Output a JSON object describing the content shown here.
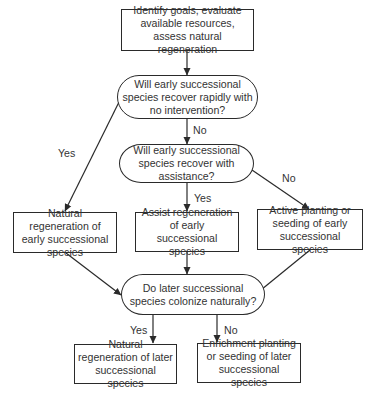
{
  "flowchart": {
    "nodes": {
      "start": {
        "text": "Identify goals, evaluate available resources, assess natural regeneration",
        "shape": "rectangle"
      },
      "q1": {
        "text": "Will early successional species recover rapidly with no intervention?",
        "shape": "rounded"
      },
      "q2": {
        "text": "Will early successional species recover with assistance?",
        "shape": "rounded"
      },
      "a_natural_early": {
        "text": "Natural regeneration of early successional species",
        "shape": "rectangle"
      },
      "a_assist_early": {
        "text": "Assist regeneration of early successional species",
        "shape": "rectangle"
      },
      "a_active_early": {
        "text": "Active planting or seeding of early successional species",
        "shape": "rectangle"
      },
      "q3": {
        "text": "Do later successional species colonize naturally?",
        "shape": "rounded"
      },
      "a_natural_later": {
        "text": "Natural regeneration of later successional species",
        "shape": "rectangle"
      },
      "a_enrich_later": {
        "text": "Enrichment planting or seeding of later successional species",
        "shape": "rectangle"
      }
    },
    "edge_labels": {
      "q1_yes": "Yes",
      "q1_no": "No",
      "q2_yes": "Yes",
      "q2_no": "No",
      "q3_yes": "Yes",
      "q3_no": "No"
    },
    "edges": [
      {
        "from": "start",
        "to": "q1",
        "label": ""
      },
      {
        "from": "q1",
        "to": "a_natural_early",
        "label": "Yes"
      },
      {
        "from": "q1",
        "to": "q2",
        "label": "No"
      },
      {
        "from": "q2",
        "to": "a_assist_early",
        "label": "Yes"
      },
      {
        "from": "q2",
        "to": "a_active_early",
        "label": "No"
      },
      {
        "from": "a_natural_early",
        "to": "q3",
        "label": ""
      },
      {
        "from": "a_assist_early",
        "to": "q3",
        "label": ""
      },
      {
        "from": "a_active_early",
        "to": "q3",
        "label": ""
      },
      {
        "from": "q3",
        "to": "a_natural_later",
        "label": "Yes"
      },
      {
        "from": "q3",
        "to": "a_enrich_later",
        "label": "No"
      }
    ],
    "colors": {
      "stroke": "#2a2a2a",
      "text": "#333333",
      "background": "#ffffff"
    }
  }
}
